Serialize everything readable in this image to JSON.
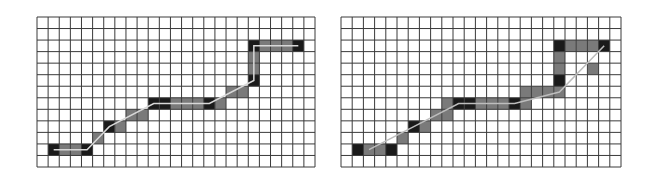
{
  "grid": {
    "cols": 25,
    "rows": 13,
    "line_color": "#3a3a3a",
    "background": "#ffffff",
    "dark_cell_color": "#1a1a1a",
    "gray_cell_color": "#7a7a7a"
  },
  "panels": [
    {
      "id": "left",
      "x": 37,
      "y": 17,
      "width": 278,
      "height": 150,
      "path_line_color": "#d8d8d8",
      "cells": [
        {
          "c": 1,
          "r": 11,
          "t": "dark"
        },
        {
          "c": 2,
          "r": 11,
          "t": "gray"
        },
        {
          "c": 3,
          "r": 11,
          "t": "gray"
        },
        {
          "c": 4,
          "r": 11,
          "t": "dark"
        },
        {
          "c": 5,
          "r": 10,
          "t": "gray"
        },
        {
          "c": 6,
          "r": 9,
          "t": "dark"
        },
        {
          "c": 7,
          "r": 9,
          "t": "gray"
        },
        {
          "c": 8,
          "r": 8,
          "t": "gray"
        },
        {
          "c": 9,
          "r": 8,
          "t": "gray"
        },
        {
          "c": 10,
          "r": 7,
          "t": "dark"
        },
        {
          "c": 11,
          "r": 7,
          "t": "dark"
        },
        {
          "c": 12,
          "r": 7,
          "t": "gray"
        },
        {
          "c": 13,
          "r": 7,
          "t": "gray"
        },
        {
          "c": 14,
          "r": 7,
          "t": "gray"
        },
        {
          "c": 15,
          "r": 7,
          "t": "dark"
        },
        {
          "c": 16,
          "r": 7,
          "t": "gray"
        },
        {
          "c": 17,
          "r": 6,
          "t": "gray"
        },
        {
          "c": 18,
          "r": 6,
          "t": "gray"
        },
        {
          "c": 19,
          "r": 5,
          "t": "dark"
        },
        {
          "c": 19,
          "r": 4,
          "t": "gray"
        },
        {
          "c": 19,
          "r": 3,
          "t": "gray"
        },
        {
          "c": 19,
          "r": 2,
          "t": "dark"
        },
        {
          "c": 20,
          "r": 2,
          "t": "gray"
        },
        {
          "c": 21,
          "r": 2,
          "t": "gray"
        },
        {
          "c": 22,
          "r": 2,
          "t": "gray"
        },
        {
          "c": 23,
          "r": 2,
          "t": "dark"
        }
      ],
      "path_points": [
        [
          1,
          11
        ],
        [
          4,
          11
        ],
        [
          6,
          9
        ],
        [
          10,
          7
        ],
        [
          15,
          7
        ],
        [
          19,
          5
        ],
        [
          19,
          2
        ],
        [
          23,
          2
        ]
      ]
    },
    {
      "id": "right",
      "x": 341,
      "y": 17,
      "width": 280,
      "height": 150,
      "path_line_color": "#bdbdbd",
      "cells": [
        {
          "c": 1,
          "r": 11,
          "t": "dark"
        },
        {
          "c": 2,
          "r": 11,
          "t": "gray"
        },
        {
          "c": 3,
          "r": 11,
          "t": "gray"
        },
        {
          "c": 4,
          "r": 11,
          "t": "dark"
        },
        {
          "c": 5,
          "r": 10,
          "t": "gray"
        },
        {
          "c": 6,
          "r": 9,
          "t": "dark"
        },
        {
          "c": 7,
          "r": 9,
          "t": "gray"
        },
        {
          "c": 8,
          "r": 8,
          "t": "gray"
        },
        {
          "c": 9,
          "r": 8,
          "t": "gray"
        },
        {
          "c": 9,
          "r": 7,
          "t": "gray"
        },
        {
          "c": 10,
          "r": 7,
          "t": "dark"
        },
        {
          "c": 11,
          "r": 7,
          "t": "dark"
        },
        {
          "c": 12,
          "r": 7,
          "t": "gray"
        },
        {
          "c": 13,
          "r": 7,
          "t": "gray"
        },
        {
          "c": 14,
          "r": 7,
          "t": "gray"
        },
        {
          "c": 15,
          "r": 7,
          "t": "dark"
        },
        {
          "c": 16,
          "r": 7,
          "t": "gray"
        },
        {
          "c": 16,
          "r": 6,
          "t": "gray"
        },
        {
          "c": 17,
          "r": 6,
          "t": "gray"
        },
        {
          "c": 18,
          "r": 6,
          "t": "gray"
        },
        {
          "c": 19,
          "r": 6,
          "t": "gray"
        },
        {
          "c": 19,
          "r": 5,
          "t": "dark"
        },
        {
          "c": 19,
          "r": 4,
          "t": "gray"
        },
        {
          "c": 19,
          "r": 3,
          "t": "gray"
        },
        {
          "c": 19,
          "r": 2,
          "t": "dark"
        },
        {
          "c": 20,
          "r": 2,
          "t": "gray"
        },
        {
          "c": 21,
          "r": 2,
          "t": "gray"
        },
        {
          "c": 22,
          "r": 2,
          "t": "gray"
        },
        {
          "c": 23,
          "r": 2,
          "t": "dark"
        },
        {
          "c": 22,
          "r": 4,
          "t": "gray"
        }
      ],
      "path_points": [
        [
          2,
          11
        ],
        [
          6,
          9
        ],
        [
          10,
          7
        ],
        [
          15,
          7
        ],
        [
          19,
          6
        ],
        [
          23,
          2
        ]
      ]
    }
  ]
}
